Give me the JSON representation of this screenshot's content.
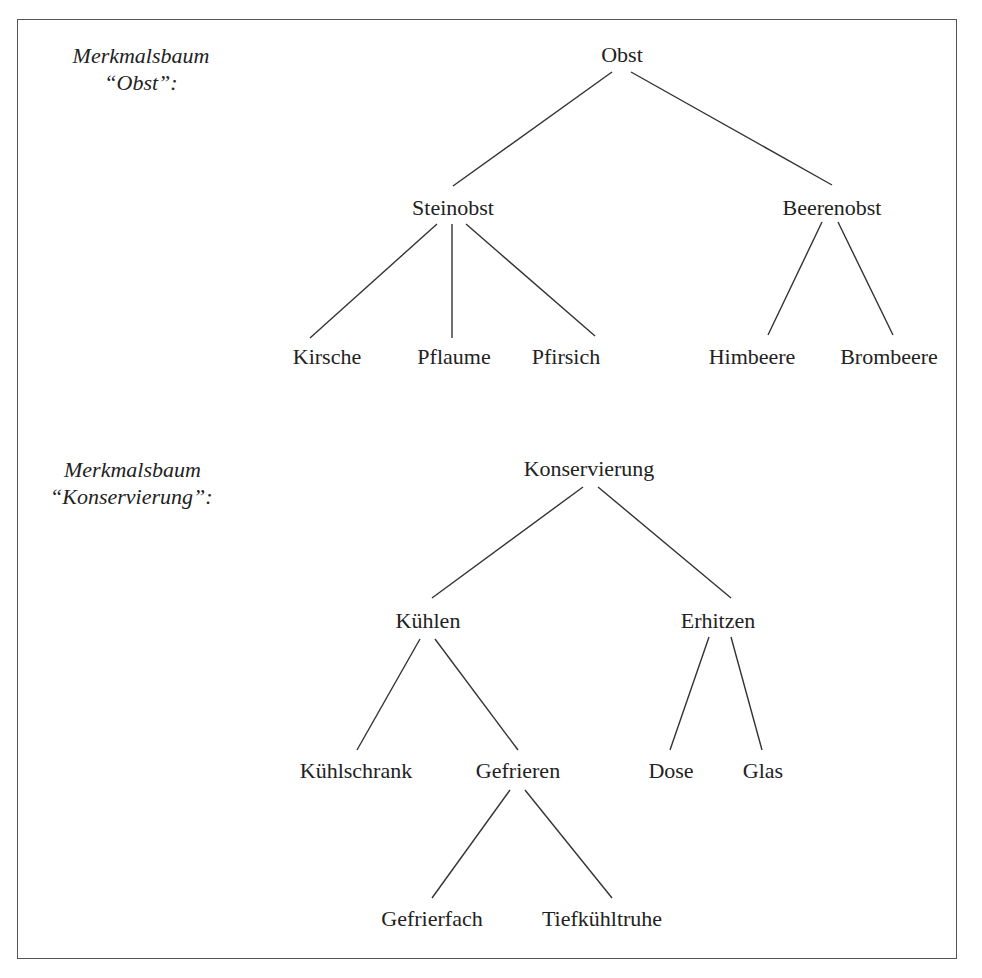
{
  "trees": [
    {
      "caption_line1": "Merkmalsbaum",
      "caption_line2": "“Obst”:",
      "root": "Obst",
      "level1": [
        "Steinobst",
        "Beerenobst"
      ],
      "level2": {
        "Steinobst": [
          "Kirsche",
          "Pflaume",
          "Pfirsich"
        ],
        "Beerenobst": [
          "Himbeere",
          "Brombeere"
        ]
      }
    },
    {
      "caption_line1": "Merkmalsbaum",
      "caption_line2": "“Konservierung”:",
      "root": "Konservierung",
      "level1": [
        "Kühlen",
        "Erhitzen"
      ],
      "level2": {
        "Kühlen": [
          "Kühlschrank",
          "Gefrieren"
        ],
        "Erhitzen": [
          "Dose",
          "Glas"
        ]
      },
      "level3": {
        "Gefrieren": [
          "Gefrierfach",
          "Tiefkühltruhe"
        ]
      }
    }
  ],
  "nodes": {
    "obst": "Obst",
    "steinobst": "Steinobst",
    "beerenobst": "Beerenobst",
    "kirsche": "Kirsche",
    "pflaume": "Pflaume",
    "pfirsich": "Pfirsich",
    "himbeere": "Himbeere",
    "brombeere": "Brombeere",
    "konservierung": "Konservierung",
    "kuehlen": "Kühlen",
    "erhitzen": "Erhitzen",
    "kuehlschrank": "Kühlschrank",
    "gefrieren": "Gefrieren",
    "dose": "Dose",
    "glas": "Glas",
    "gefrierfach": "Gefrierfach",
    "tiefkuehltruhe": "Tiefkühltruhe"
  },
  "captions": {
    "obst_line1": "Merkmalsbaum",
    "obst_line2": "“Obst”:",
    "konservierung_line1": "Merkmalsbaum",
    "konservierung_line2": "“Konservierung”:"
  }
}
